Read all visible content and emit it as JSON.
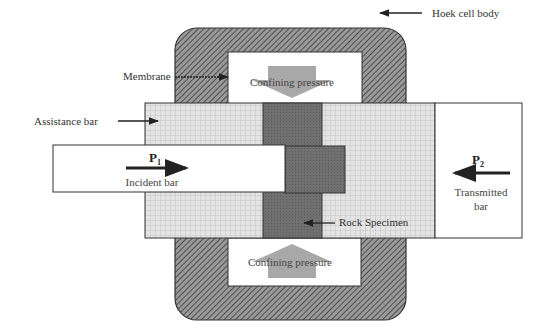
{
  "labels": {
    "hoek_cell_body": "Hoek cell body",
    "membrane": "Membrane",
    "assistance_bar": "Assistance bar",
    "rock_specimen": "Rock Specimen",
    "confining_pressure_top": "Confining pressure",
    "confining_pressure_bottom": "Confining pressure",
    "incident_bar": "Incident bar",
    "transmitted_bar_line1": "Transmitted",
    "transmitted_bar_line2": "bar",
    "p1_main": "P",
    "p1_sub": "1",
    "p2_main": "P",
    "p2_sub": "2"
  },
  "colors": {
    "cell_body": "#6e6e6e",
    "assistance_bar": "#dcdcdc",
    "specimen": "#707070",
    "pressure_arrow": "#a8a8a8",
    "outline": "#333333"
  }
}
